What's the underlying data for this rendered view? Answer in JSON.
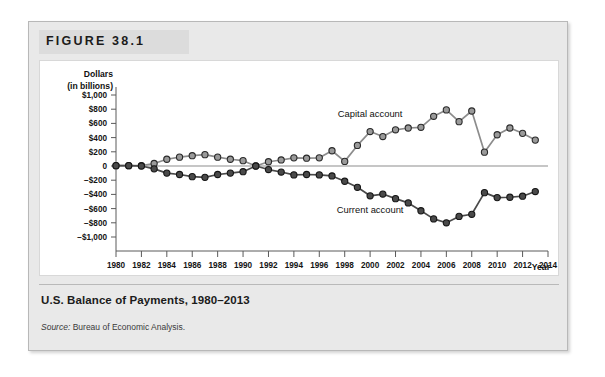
{
  "figure": {
    "label": "FIGURE 38.1",
    "caption": "U.S. Balance of Payments, 1980–2013",
    "source_label": "Source:",
    "source_text": " Bureau of Economic Analysis."
  },
  "chart_data": {
    "type": "line",
    "title": "U.S. Balance of Payments, 1980–2013",
    "xlabel": "Year",
    "ylabel": "Dollars (in billions)",
    "ylabel_line1": "Dollars",
    "ylabel_line2": "(in billions)",
    "xlim": [
      1980,
      2014
    ],
    "ylim": [
      -1000,
      1000
    ],
    "grid": false,
    "legend_position": "inline-annotations",
    "y_ticks": [
      1000,
      800,
      600,
      400,
      200,
      0,
      -200,
      -400,
      -600,
      -800,
      -1000
    ],
    "y_tick_labels": [
      "$1,000",
      "$800",
      "$600",
      "$400",
      "$200",
      "0",
      "−$200",
      "−$400",
      "−$600",
      "−$800",
      "−$1,000"
    ],
    "x_ticks": [
      1980,
      1982,
      1984,
      1986,
      1988,
      1990,
      1992,
      1994,
      1996,
      1998,
      2000,
      2002,
      2004,
      2006,
      2008,
      2010,
      2012,
      2014
    ],
    "x_tick_labels": [
      "1980",
      "1982",
      "1984",
      "1986",
      "1988",
      "1990",
      "1992",
      "1994",
      "1996",
      "1998",
      "2000",
      "2002",
      "2004",
      "2006",
      "2008",
      "2010",
      "2012",
      "2014"
    ],
    "x": [
      1980,
      1981,
      1982,
      1983,
      1984,
      1985,
      1986,
      1987,
      1988,
      1989,
      1990,
      1991,
      1992,
      1993,
      1994,
      1995,
      1996,
      1997,
      1998,
      1999,
      2000,
      2001,
      2002,
      2003,
      2004,
      2005,
      2006,
      2007,
      2008,
      2009,
      2010,
      2011,
      2012,
      2013
    ],
    "series": [
      {
        "name": "Capital account",
        "color": "#9a9a9a",
        "values": [
          5,
          5,
          5,
          35,
          95,
          125,
          145,
          160,
          125,
          95,
          75,
          0,
          60,
          85,
          115,
          110,
          115,
          215,
          65,
          290,
          485,
          415,
          510,
          535,
          545,
          700,
          790,
          625,
          775,
          195,
          440,
          535,
          460,
          365
        ]
      },
      {
        "name": "Current account",
        "color": "#4a4a4a",
        "values": [
          5,
          5,
          0,
          -40,
          -100,
          -120,
          -150,
          -160,
          -120,
          -100,
          -80,
          0,
          -50,
          -85,
          -125,
          -120,
          -125,
          -140,
          -215,
          -300,
          -420,
          -395,
          -460,
          -520,
          -630,
          -745,
          -800,
          -710,
          -680,
          -375,
          -445,
          -440,
          -425,
          -360
        ]
      }
    ],
    "annotations": [
      {
        "text": "Capital account",
        "x": 2000,
        "y": 690
      },
      {
        "text": "Current account",
        "x": 2000,
        "y": -655
      }
    ]
  }
}
